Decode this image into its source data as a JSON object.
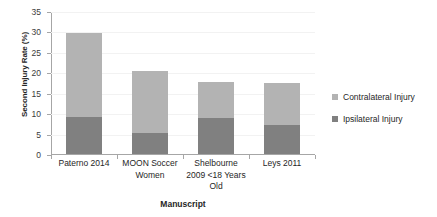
{
  "chart_data": {
    "type": "bar",
    "subtype": "stacked-bar",
    "title": "",
    "xlabel": "Manuscript",
    "ylabel": "Second Injury Rate (%)",
    "ylim": [
      0,
      35
    ],
    "yticks": [
      0,
      5,
      10,
      15,
      20,
      25,
      30,
      35
    ],
    "grid": "horizontal",
    "legend_position": "right",
    "categories": [
      "Paterno 2014",
      "MOON Soccer Women",
      "Shelbourne 2009 <18 Years Old",
      "Leys 2011"
    ],
    "series": [
      {
        "name": "Ipsilateral Injury",
        "color": "#808080",
        "values": [
          9.0,
          5.1,
          8.8,
          7.2
        ]
      },
      {
        "name": "Contralateral Injury",
        "color": "#b3b3b3",
        "values": [
          20.5,
          15.1,
          8.8,
          10.1
        ]
      }
    ],
    "totals": [
      29.5,
      20.2,
      17.6,
      17.3
    ]
  },
  "axes": {
    "y_title": "Second Injury Rate (%)",
    "x_title": "Manuscript",
    "y_tick_labels": [
      "35",
      "30",
      "25",
      "20",
      "15",
      "10",
      "5",
      "0"
    ],
    "x_tick_labels": [
      "Paterno 2014",
      "MOON Soccer\nWomen",
      "Shelbourne\n2009 <18 Years\nOld",
      "Leys 2011"
    ],
    "category_lines": [
      [
        "Paterno 2014"
      ],
      [
        "MOON Soccer",
        "Women"
      ],
      [
        "Shelbourne",
        "2009 <18 Years",
        "Old"
      ],
      [
        "Leys 2011"
      ]
    ]
  },
  "legend": {
    "items": [
      {
        "label": "Contralateral Injury",
        "color": "#b3b3b3"
      },
      {
        "label": "Ipsilateral Injury",
        "color": "#808080"
      }
    ]
  },
  "colors": {
    "contralateral": "#b3b3b3",
    "ipsilateral": "#808080",
    "axis": "#a6a6a6",
    "gridline": "#f2f2f2",
    "background": "#ffffff",
    "text": "#262626"
  }
}
